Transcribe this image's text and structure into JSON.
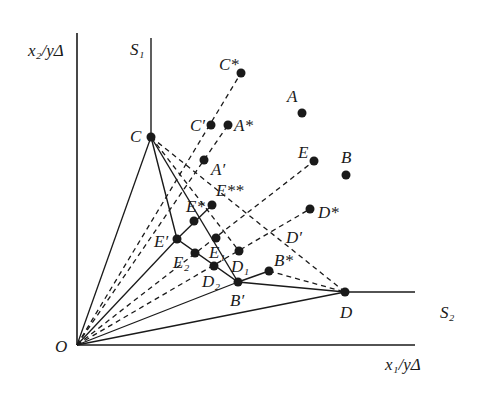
{
  "figure": {
    "type": "DEA efficiency frontier diagram",
    "axes": {
      "y_label": "x₂/yΔ",
      "x_label": "x₁/yΔ",
      "origin_label": "O"
    },
    "frontier_labels": {
      "s1": "S₁",
      "s2": "S₂"
    },
    "colors": {
      "ink": "#1a1a1a",
      "background": "#ffffff"
    },
    "points": [
      {
        "id": "C",
        "label": "C",
        "x": 151,
        "y": 137
      },
      {
        "id": "D",
        "label": "D",
        "x": 345,
        "y": 292
      },
      {
        "id": "B_prime",
        "label": "B′",
        "x": 238,
        "y": 282
      },
      {
        "id": "B_star",
        "label": "B*",
        "x": 269,
        "y": 271
      },
      {
        "id": "D1",
        "label": "D₁",
        "x": 239,
        "y": 251
      },
      {
        "id": "D2",
        "label": "D₂",
        "x": 214,
        "y": 266
      },
      {
        "id": "E1",
        "label": "E₁",
        "x": 216,
        "y": 238
      },
      {
        "id": "E2",
        "label": "E₂",
        "x": 195,
        "y": 253
      },
      {
        "id": "E_prime",
        "label": "E′",
        "x": 177,
        "y": 239
      },
      {
        "id": "E_star",
        "label": "E*",
        "x": 194,
        "y": 221
      },
      {
        "id": "E_2star",
        "label": "E**",
        "x": 212,
        "y": 205
      },
      {
        "id": "A_prime",
        "label": "A′",
        "x": 204,
        "y": 160
      },
      {
        "id": "C_prime",
        "label": "C′",
        "x": 211,
        "y": 125
      },
      {
        "id": "A_star",
        "label": "A*",
        "x": 228,
        "y": 125
      },
      {
        "id": "C_star",
        "label": "C*",
        "x": 241,
        "y": 73
      },
      {
        "id": "A",
        "label": "A",
        "x": 302,
        "y": 113
      },
      {
        "id": "E",
        "label": "E",
        "x": 314,
        "y": 161
      },
      {
        "id": "B",
        "label": "B",
        "x": 346,
        "y": 175
      },
      {
        "id": "D_star",
        "label": "D*",
        "x": 310,
        "y": 209
      }
    ],
    "extra_labels": [
      {
        "id": "D_prime",
        "label": "D′",
        "x": 286,
        "y": 243
      }
    ]
  }
}
